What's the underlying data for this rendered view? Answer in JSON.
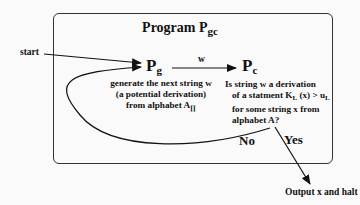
{
  "diagram": {
    "title": {
      "text": "Program P",
      "subscript": "gc"
    },
    "start_label": "start",
    "generator": {
      "symbol": "P",
      "subscript": "g",
      "description_lines": [
        "generate the next string w",
        "(a potential derivation)",
        "from alphabet A"
      ],
      "alphabet_subscript": "∏"
    },
    "edge_label": "w",
    "checker": {
      "symbol": "P",
      "subscript": "c",
      "description_lines": [
        "Is string w a derivation",
        "of a statment K",
        "for some string x from",
        "alphabet A?"
      ],
      "statement": {
        "K_sub": "L",
        "middle": " (x) > u",
        "u_sub": "L"
      }
    },
    "no_label": "No",
    "yes_label": "Yes",
    "output_label": "Output x and halt"
  }
}
